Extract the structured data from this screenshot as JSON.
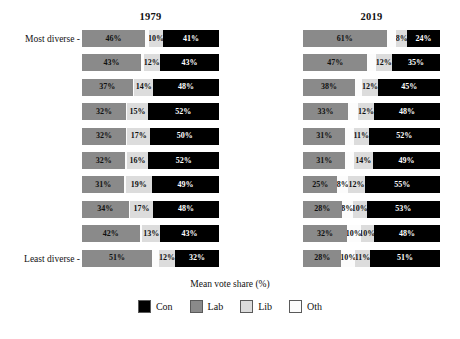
{
  "axis": {
    "caption": "Mean vote share (%)",
    "ylabel_top": "Most diverse -",
    "ylabel_bottom": "Least diverse -"
  },
  "panels": {
    "left": {
      "title": "1979"
    },
    "right": {
      "title": "2019"
    }
  },
  "legend": {
    "items": [
      {
        "label": "Con",
        "color": "#000000"
      },
      {
        "label": "Lab",
        "color": "#8a8a8a"
      },
      {
        "label": "Lib",
        "color": "#dcdcdc"
      },
      {
        "label": "Oth",
        "color": "#fcfcfc"
      }
    ]
  },
  "chart_data": {
    "type": "bar",
    "title": "",
    "subtitle": "",
    "xlabel": "Mean vote share (%)",
    "ylabel": "",
    "xlim": [
      0,
      100
    ],
    "grid": false,
    "legend_position": "bottom",
    "orientation": "horizontal",
    "stacked": true,
    "categories": [
      "Most diverse",
      "Decile 2",
      "Decile 3",
      "Decile 4",
      "Decile 5",
      "Decile 6",
      "Decile 7",
      "Decile 8",
      "Decile 9",
      "Least diverse"
    ],
    "series_order": [
      "Lab",
      "Oth",
      "Lib",
      "Con"
    ],
    "panels": [
      {
        "title": "1979",
        "rows": [
          {
            "segments": [
              {
                "party": "Lab",
                "value": 46,
                "label": "46%"
              },
              {
                "party": "Oth",
                "value": 3,
                "label": ""
              },
              {
                "party": "Lib",
                "value": 10,
                "label": "10%"
              },
              {
                "party": "Con",
                "value": 41,
                "label": "41%"
              }
            ]
          },
          {
            "segments": [
              {
                "party": "Lab",
                "value": 43,
                "label": "43%"
              },
              {
                "party": "Oth",
                "value": 2,
                "label": ""
              },
              {
                "party": "Lib",
                "value": 12,
                "label": "12%"
              },
              {
                "party": "Con",
                "value": 43,
                "label": "43%"
              }
            ]
          },
          {
            "segments": [
              {
                "party": "Lab",
                "value": 37,
                "label": "37%"
              },
              {
                "party": "Oth",
                "value": 1,
                "label": ""
              },
              {
                "party": "Lib",
                "value": 14,
                "label": "14%"
              },
              {
                "party": "Con",
                "value": 48,
                "label": "48%"
              }
            ]
          },
          {
            "segments": [
              {
                "party": "Lab",
                "value": 32,
                "label": "32%"
              },
              {
                "party": "Oth",
                "value": 1,
                "label": ""
              },
              {
                "party": "Lib",
                "value": 15,
                "label": "15%"
              },
              {
                "party": "Con",
                "value": 52,
                "label": "52%"
              }
            ]
          },
          {
            "segments": [
              {
                "party": "Lab",
                "value": 32,
                "label": "32%"
              },
              {
                "party": "Oth",
                "value": 1,
                "label": ""
              },
              {
                "party": "Lib",
                "value": 17,
                "label": "17%"
              },
              {
                "party": "Con",
                "value": 50,
                "label": "50%"
              }
            ]
          },
          {
            "segments": [
              {
                "party": "Lab",
                "value": 32,
                "label": "32%"
              },
              {
                "party": "Oth",
                "value": 1,
                "label": ""
              },
              {
                "party": "Lib",
                "value": 16,
                "label": "16%"
              },
              {
                "party": "Con",
                "value": 52,
                "label": "52%"
              }
            ]
          },
          {
            "segments": [
              {
                "party": "Lab",
                "value": 31,
                "label": "31%"
              },
              {
                "party": "Oth",
                "value": 1,
                "label": ""
              },
              {
                "party": "Lib",
                "value": 19,
                "label": "19%"
              },
              {
                "party": "Con",
                "value": 49,
                "label": "49%"
              }
            ]
          },
          {
            "segments": [
              {
                "party": "Lab",
                "value": 34,
                "label": "34%"
              },
              {
                "party": "Oth",
                "value": 1,
                "label": ""
              },
              {
                "party": "Lib",
                "value": 17,
                "label": "17%"
              },
              {
                "party": "Con",
                "value": 48,
                "label": "48%"
              }
            ]
          },
          {
            "segments": [
              {
                "party": "Lab",
                "value": 42,
                "label": "42%"
              },
              {
                "party": "Oth",
                "value": 2,
                "label": ""
              },
              {
                "party": "Lib",
                "value": 13,
                "label": "13%"
              },
              {
                "party": "Con",
                "value": 43,
                "label": "43%"
              }
            ]
          },
          {
            "segments": [
              {
                "party": "Lab",
                "value": 51,
                "label": "51%"
              },
              {
                "party": "Oth",
                "value": 5,
                "label": ""
              },
              {
                "party": "Lib",
                "value": 12,
                "label": "12%"
              },
              {
                "party": "Con",
                "value": 32,
                "label": "32%"
              }
            ]
          }
        ]
      },
      {
        "title": "2019",
        "rows": [
          {
            "segments": [
              {
                "party": "Lab",
                "value": 61,
                "label": "61%"
              },
              {
                "party": "Oth",
                "value": 7,
                "label": ""
              },
              {
                "party": "Lib",
                "value": 8,
                "label": "8%"
              },
              {
                "party": "Con",
                "value": 24,
                "label": "24%"
              }
            ]
          },
          {
            "segments": [
              {
                "party": "Lab",
                "value": 47,
                "label": "47%"
              },
              {
                "party": "Oth",
                "value": 6,
                "label": ""
              },
              {
                "party": "Lib",
                "value": 12,
                "label": "12%"
              },
              {
                "party": "Con",
                "value": 35,
                "label": "35%"
              }
            ]
          },
          {
            "segments": [
              {
                "party": "Lab",
                "value": 38,
                "label": "38%"
              },
              {
                "party": "Oth",
                "value": 5,
                "label": ""
              },
              {
                "party": "Lib",
                "value": 12,
                "label": "12%"
              },
              {
                "party": "Con",
                "value": 45,
                "label": "45%"
              }
            ]
          },
          {
            "segments": [
              {
                "party": "Lab",
                "value": 33,
                "label": "33%"
              },
              {
                "party": "Oth",
                "value": 7,
                "label": ""
              },
              {
                "party": "Lib",
                "value": 12,
                "label": "12%"
              },
              {
                "party": "Con",
                "value": 48,
                "label": "48%"
              }
            ]
          },
          {
            "segments": [
              {
                "party": "Lab",
                "value": 31,
                "label": "31%"
              },
              {
                "party": "Oth",
                "value": 6,
                "label": ""
              },
              {
                "party": "Lib",
                "value": 11,
                "label": "11%"
              },
              {
                "party": "Con",
                "value": 52,
                "label": "52%"
              }
            ]
          },
          {
            "segments": [
              {
                "party": "Lab",
                "value": 31,
                "label": "31%"
              },
              {
                "party": "Oth",
                "value": 6,
                "label": ""
              },
              {
                "party": "Lib",
                "value": 14,
                "label": "14%"
              },
              {
                "party": "Con",
                "value": 49,
                "label": "49%"
              }
            ]
          },
          {
            "segments": [
              {
                "party": "Lab",
                "value": 25,
                "label": "25%"
              },
              {
                "party": "Oth",
                "value": 8,
                "label": "8%"
              },
              {
                "party": "Lib",
                "value": 12,
                "label": "12%"
              },
              {
                "party": "Con",
                "value": 55,
                "label": "55%"
              }
            ]
          },
          {
            "segments": [
              {
                "party": "Lab",
                "value": 28,
                "label": "28%"
              },
              {
                "party": "Oth",
                "value": 8,
                "label": "8%"
              },
              {
                "party": "Lib",
                "value": 10,
                "label": "10%"
              },
              {
                "party": "Con",
                "value": 53,
                "label": "53%"
              }
            ]
          },
          {
            "segments": [
              {
                "party": "Lab",
                "value": 32,
                "label": "32%"
              },
              {
                "party": "Oth",
                "value": 10,
                "label": "10%"
              },
              {
                "party": "Lib",
                "value": 10,
                "label": "10%"
              },
              {
                "party": "Con",
                "value": 48,
                "label": "48%"
              }
            ]
          },
          {
            "segments": [
              {
                "party": "Lab",
                "value": 28,
                "label": "28%"
              },
              {
                "party": "Oth",
                "value": 10,
                "label": "10%"
              },
              {
                "party": "Lib",
                "value": 11,
                "label": "11%"
              },
              {
                "party": "Con",
                "value": 51,
                "label": "51%"
              }
            ]
          }
        ]
      }
    ]
  }
}
